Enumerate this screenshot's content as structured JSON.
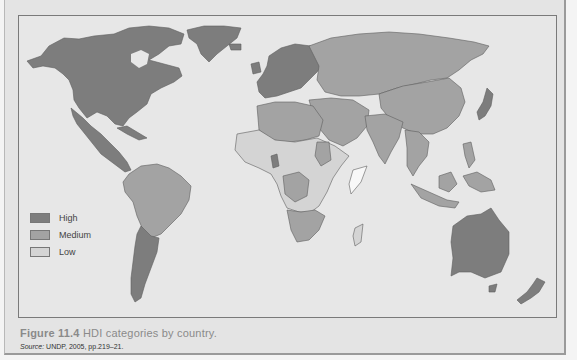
{
  "figure": {
    "label": "Figure 11.4",
    "title": "HDI categories by country.",
    "source_label": "Source:",
    "source_text": "UNDP, 2005, pp.219–21."
  },
  "legend": {
    "items": [
      {
        "label": "High",
        "color": "#7d7d7d"
      },
      {
        "label": "Medium",
        "color": "#a3a3a3"
      },
      {
        "label": "Low",
        "color": "#d4d4d4"
      }
    ]
  },
  "colors": {
    "high": "#7d7d7d",
    "medium": "#a3a3a3",
    "low": "#d4d4d4",
    "ocean": "#e7e7e7",
    "border": "#5e5e5e"
  },
  "regions": [
    {
      "name": "North America",
      "category": "High"
    },
    {
      "name": "Greenland",
      "category": "High"
    },
    {
      "name": "Mexico & Central America",
      "category": "High"
    },
    {
      "name": "South America (north)",
      "category": "Medium"
    },
    {
      "name": "Argentina & Chile",
      "category": "High"
    },
    {
      "name": "Europe",
      "category": "High"
    },
    {
      "name": "Russia & Central Asia",
      "category": "Medium"
    },
    {
      "name": "China & East Asia",
      "category": "Medium"
    },
    {
      "name": "Japan",
      "category": "High"
    },
    {
      "name": "South Asia",
      "category": "Medium"
    },
    {
      "name": "Middle East",
      "category": "Medium"
    },
    {
      "name": "North Africa",
      "category": "Medium"
    },
    {
      "name": "Sub-Saharan Africa",
      "category": "Low"
    },
    {
      "name": "Southern Africa",
      "category": "Medium"
    },
    {
      "name": "Southeast Asia",
      "category": "Medium"
    },
    {
      "name": "Australia",
      "category": "High"
    },
    {
      "name": "New Zealand",
      "category": "High"
    }
  ]
}
